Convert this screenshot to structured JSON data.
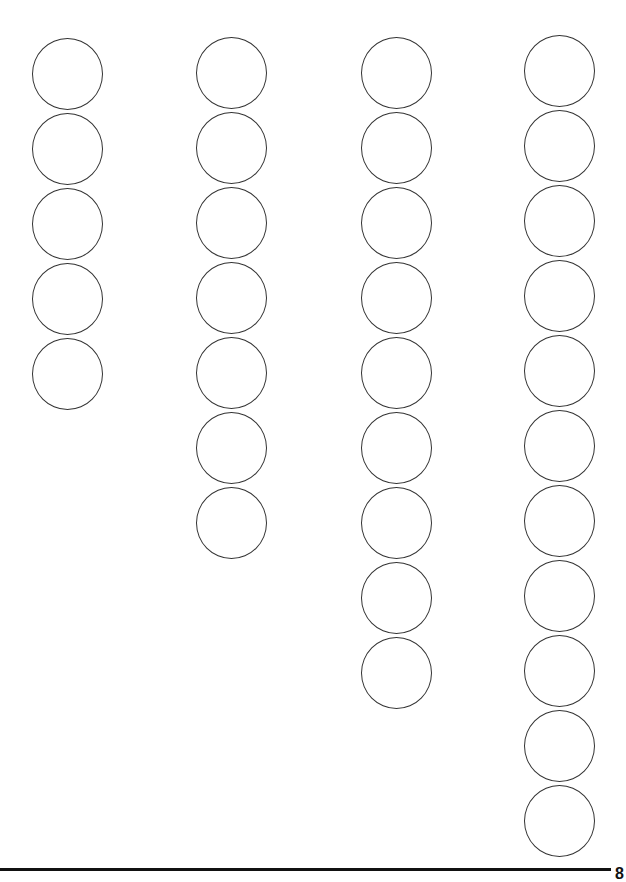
{
  "worksheet": {
    "columns": [
      {
        "count": 5,
        "left": 32,
        "top": 38
      },
      {
        "count": 7,
        "left": 196,
        "top": 37
      },
      {
        "count": 9,
        "left": 361,
        "top": 37
      },
      {
        "count": 11,
        "left": 524,
        "top": 35
      }
    ],
    "circle_step": 75,
    "stroke_color": "#333333"
  },
  "footer": {
    "page_number": "8"
  }
}
